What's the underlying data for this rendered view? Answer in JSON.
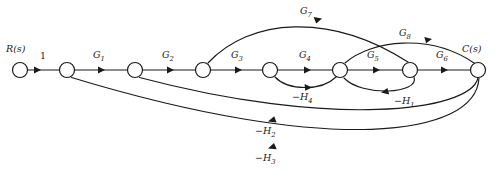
{
  "diagram": {
    "type": "signal-flow-graph",
    "background_color": "#ffffff",
    "stroke_color": "#1a1a1a",
    "width": 495,
    "height": 174
  },
  "terminals": {
    "input_label": "R(s)",
    "output_label": "C(s)"
  },
  "nodes": [
    {
      "id": "n1",
      "name": "input-node",
      "x": 20,
      "y": 70,
      "r": 7.5
    },
    {
      "id": "n2",
      "name": "node-2",
      "x": 67,
      "y": 70,
      "r": 7.5
    },
    {
      "id": "n3",
      "name": "node-3",
      "x": 135,
      "y": 70,
      "r": 7.5
    },
    {
      "id": "n4",
      "name": "node-4",
      "x": 203,
      "y": 70,
      "r": 7.5
    },
    {
      "id": "n5",
      "name": "node-5",
      "x": 270,
      "y": 70,
      "r": 7.5
    },
    {
      "id": "n6",
      "name": "node-6",
      "x": 340,
      "y": 70,
      "r": 7.5
    },
    {
      "id": "n7",
      "name": "node-7",
      "x": 410,
      "y": 70,
      "r": 7.5
    },
    {
      "id": "n8",
      "name": "output-node",
      "x": 478,
      "y": 70,
      "r": 7.5
    }
  ],
  "edges": [
    {
      "id": "e_unity",
      "label": "1",
      "gain": "1",
      "from": "n1",
      "to": "n2",
      "kind": "forward",
      "label_x": 43,
      "label_y": 59
    },
    {
      "id": "e_g1",
      "label": "G",
      "sub": "1",
      "from": "n2",
      "to": "n3",
      "kind": "forward",
      "label_x": 97,
      "label_y": 58
    },
    {
      "id": "e_g2",
      "label": "G",
      "sub": "2",
      "from": "n3",
      "to": "n4",
      "kind": "forward",
      "label_x": 166,
      "label_y": 58
    },
    {
      "id": "e_g3",
      "label": "G",
      "sub": "3",
      "from": "n4",
      "to": "n5",
      "kind": "forward",
      "label_x": 235,
      "label_y": 58
    },
    {
      "id": "e_g4",
      "label": "G",
      "sub": "4",
      "from": "n5",
      "to": "n6",
      "kind": "forward",
      "label_x": 303,
      "label_y": 58
    },
    {
      "id": "e_g5",
      "label": "G",
      "sub": "5",
      "from": "n6",
      "to": "n7",
      "kind": "forward",
      "label_x": 371,
      "label_y": 58
    },
    {
      "id": "e_g6",
      "label": "G",
      "sub": "6",
      "from": "n7",
      "to": "n8",
      "kind": "forward",
      "label_x": 440,
      "label_y": 58
    },
    {
      "id": "e_g7",
      "label": "G",
      "sub": "7",
      "from": "n4",
      "to": "n7",
      "kind": "forward-arc-above",
      "label_x": 305,
      "label_y": 14
    },
    {
      "id": "e_g8",
      "label": "G",
      "sub": "8",
      "from": "n6",
      "to": "n8",
      "kind": "forward-arc-above",
      "label_x": 404,
      "label_y": 36
    },
    {
      "id": "e_h4",
      "label": "−H",
      "sub": "4",
      "from": "n5",
      "to": "n6",
      "kind": "feedforward-arc-below",
      "label_x": 300,
      "label_y": 99
    },
    {
      "id": "e_h1",
      "label": "−H",
      "sub": "1",
      "from": "n7",
      "to": "n6",
      "kind": "feedback-arc-below",
      "label_x": 403,
      "label_y": 103
    },
    {
      "id": "e_h2",
      "label": "−H",
      "sub": "2",
      "from": "n8",
      "to": "n3",
      "kind": "feedback-arc-below",
      "label_x": 263,
      "label_y": 133
    },
    {
      "id": "e_h3",
      "label": "−H",
      "sub": "3",
      "from": "n8",
      "to": "n2",
      "kind": "feedback-arc-below",
      "label_x": 263,
      "label_y": 160
    }
  ]
}
